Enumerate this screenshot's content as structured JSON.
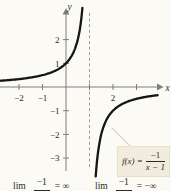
{
  "figure": {
    "background": "#fbfaf5"
  },
  "formula_box": {
    "lhs": "f(x) =",
    "numerator": "−1",
    "denominator": "x − 1",
    "bg_color": "#f1ecdd"
  },
  "limits": {
    "left": {
      "operator": "lim",
      "numerator": "−1",
      "result": "= ∞"
    },
    "right": {
      "operator": "lim",
      "numerator": "−1",
      "result": "= −∞"
    }
  },
  "chart_data": {
    "type": "line",
    "function": "f(x) = −1/(x − 1)",
    "coef_numerator": -1,
    "pole": 1,
    "xlabel": "x",
    "ylabel": "y",
    "xlim": [
      -2.8,
      4.3
    ],
    "ylim": [
      -4.4,
      3.4
    ],
    "grid": false,
    "legend": "none",
    "x_ticks": [
      -2,
      -1,
      1,
      2,
      3
    ],
    "x_tick_labels": [
      {
        "v": -2,
        "t": "−2"
      },
      {
        "v": -1,
        "t": "−1"
      },
      {
        "v": 2,
        "t": "2"
      }
    ],
    "y_ticks": [
      2,
      1,
      -1,
      -2,
      -3
    ],
    "y_tick_labels": [
      {
        "v": 2,
        "t": "2"
      },
      {
        "v": 1,
        "t": "1"
      },
      {
        "v": -1,
        "t": "−1"
      },
      {
        "v": -2,
        "t": "−2"
      },
      {
        "v": -3,
        "t": "−3"
      }
    ],
    "asymptote": {
      "x": 1,
      "style": "dashed"
    },
    "branches": [
      {
        "name": "left",
        "x_range": [
          -2.81,
          0.7
        ]
      },
      {
        "name": "right",
        "x_range": [
          1.265,
          3.9
        ]
      }
    ],
    "sample_points": [
      [
        -2,
        0.333
      ],
      [
        -1,
        0.5
      ],
      [
        0,
        1
      ],
      [
        0.5,
        2
      ],
      [
        1.5,
        -2
      ],
      [
        2,
        -1
      ],
      [
        3,
        -0.5
      ]
    ],
    "curve_color": "#151515",
    "axis_color": "#7e7e7e",
    "asymptote_color": "#9b9b9b",
    "tick_label_color": "#2b2b2b"
  }
}
